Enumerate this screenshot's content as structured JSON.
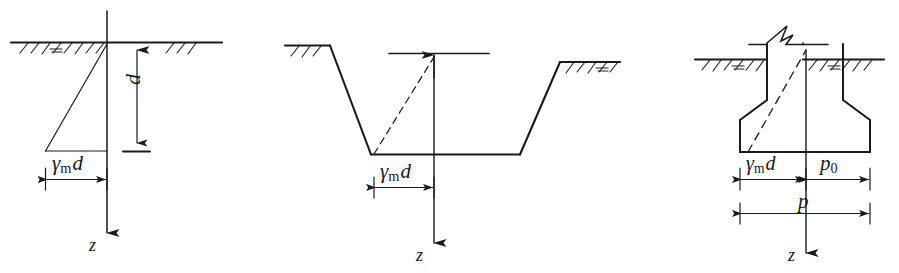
{
  "figure": {
    "type": "engineering-diagram",
    "panel_count": 3,
    "line_color": "#1a1a1a",
    "background": "#ffffff"
  },
  "panels": [
    {
      "id": "panel-natural-ground",
      "name": "natural ground self-weight stress",
      "labels": {
        "depth": "d",
        "pressure": "γ",
        "pressure_sub": "m",
        "pressure_tail": "d",
        "axis": "z"
      },
      "features": [
        "ground-line",
        "ground-hatching",
        "triangular-stress-diagram",
        "depth-dimension",
        "pressure-dimension",
        "vertical-z-axis"
      ]
    },
    {
      "id": "panel-excavation",
      "name": "excavated trench self-weight stress",
      "labels": {
        "pressure": "γ",
        "pressure_sub": "m",
        "pressure_tail": "d",
        "axis": "z"
      },
      "features": [
        "sloped-excavation",
        "trench-base",
        "ground-hatching",
        "dashed-stress-line",
        "datum-line",
        "pressure-dimension",
        "vertical-z-axis"
      ]
    },
    {
      "id": "panel-footing",
      "name": "spread footing net pressure",
      "labels": {
        "pressure": "γ",
        "pressure_sub": "m",
        "pressure_tail": "d",
        "net_pressure": "p",
        "net_pressure_sub": "0",
        "total_pressure": "p",
        "axis": "z"
      },
      "features": [
        "column-with-break-symbol",
        "spread-footing",
        "ground-line",
        "ground-hatching",
        "dashed-stress-line",
        "p0-dimension",
        "p-dimension",
        "vertical-z-axis"
      ]
    }
  ]
}
